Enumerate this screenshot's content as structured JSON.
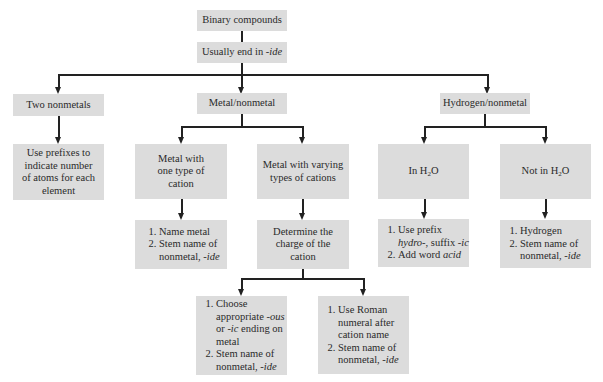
{
  "diagram": {
    "root": "Binary compounds",
    "rule": "Usually end in ",
    "rule_suffix": "-ide",
    "branches": {
      "two_nonmetals": {
        "label": "Two nonmetals",
        "result": "Use prefixes to indicate number of atoms for each element"
      },
      "metal_nonmetal": {
        "label": "Metal/nonmetal",
        "one_type": {
          "label": "Metal with one type of cation",
          "steps": [
            "Name metal",
            "Stem name of nonmetal, ",
            "-ide"
          ]
        },
        "varying_types": {
          "label": "Metal with varying types of cations",
          "determine": "Determine the charge of the cation",
          "option_a": {
            "step1_pre": "Choose appropriate ",
            "ous": "-ous",
            "or": " or ",
            "ic": "-ic",
            "step1_post": " ending on metal",
            "step2": "Stem name of nonmetal, ",
            "step2_suffix": "-ide"
          },
          "option_b": {
            "step1": "Use Roman numeral after cation name",
            "step2": "Stem name of nonmetal, ",
            "step2_suffix": "-ide"
          }
        }
      },
      "hydrogen_nonmetal": {
        "label": "Hydrogen/nonmetal",
        "in_water": {
          "label_pre": "In H",
          "label_sub": "2",
          "label_post": "O",
          "step1_pre": "Use prefix ",
          "hydro": "hydro-",
          "step1_mid": ", suffix ",
          "ic": "-ic",
          "step2_pre": "Add word ",
          "acid": "acid"
        },
        "not_in_water": {
          "label_pre": "Not in H",
          "label_sub": "2",
          "label_post": "O",
          "step1": "Hydrogen",
          "step2": "Stem name of nonmetal, ",
          "step2_suffix": "-ide"
        }
      }
    }
  }
}
